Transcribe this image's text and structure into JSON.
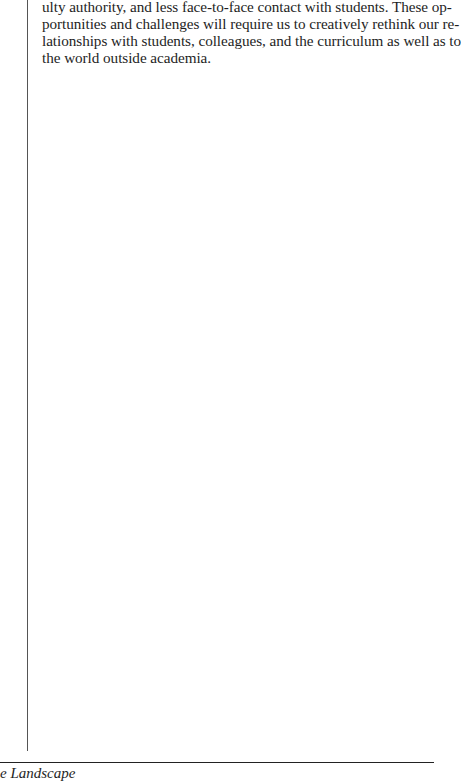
{
  "page": {
    "body_lines": [
      "ulty authority, and less face-to-face contact with students. These op-",
      "portunities and challenges will require us to creatively rethink our re-",
      "lationships with students, colleagues, and the curriculum as well as to",
      "the world outside academia."
    ],
    "footer": {
      "running_title": "e Landscape"
    }
  }
}
